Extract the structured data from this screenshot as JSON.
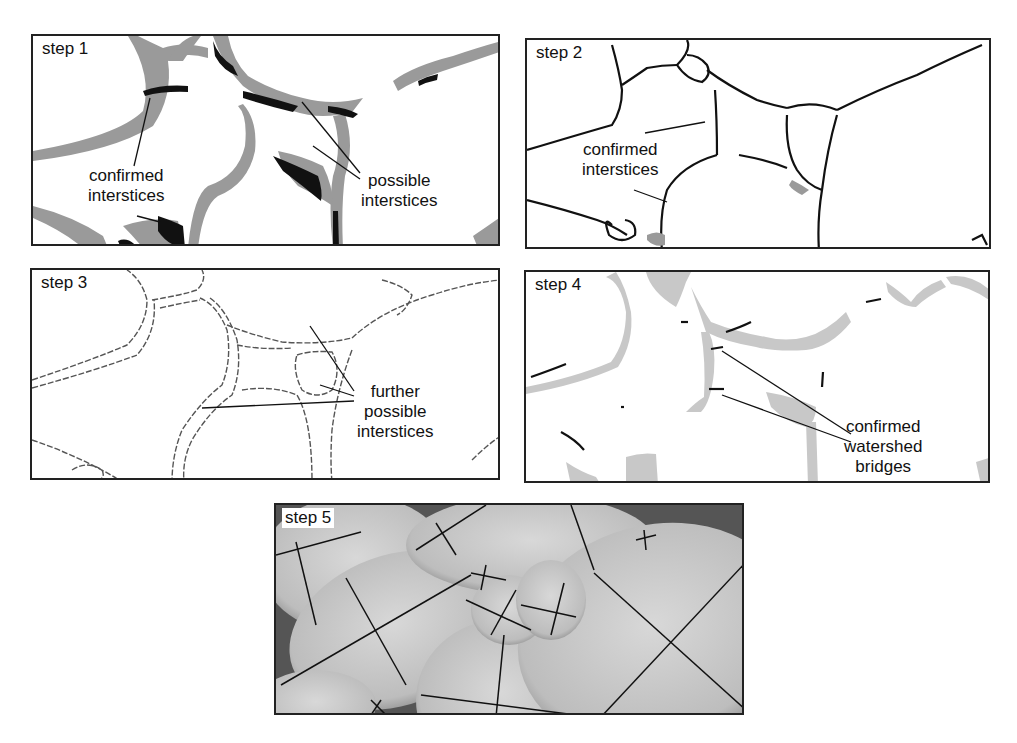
{
  "figure": {
    "panels": [
      {
        "id": "step1",
        "label": "step 1",
        "callouts": [
          {
            "text_lines": [
              "confirmed",
              "interstices"
            ],
            "line1": "confirmed",
            "line2": "interstices"
          },
          {
            "text_lines": [
              "possible",
              "interstices"
            ],
            "line1": "possible",
            "line2": "interstices"
          }
        ]
      },
      {
        "id": "step2",
        "label": "step 2",
        "callouts": [
          {
            "line1": "confirmed",
            "line2": "interstices"
          }
        ]
      },
      {
        "id": "step3",
        "label": "step 3",
        "callouts": [
          {
            "line1": "further",
            "line2": "possible",
            "line3": "interstices"
          }
        ]
      },
      {
        "id": "step4",
        "label": "step 4",
        "callouts": [
          {
            "line1": "confirmed",
            "line2": "watershed",
            "line3": "bridges"
          }
        ]
      },
      {
        "id": "step5",
        "label": "step 5",
        "callouts": []
      }
    ],
    "colors": {
      "border": "#222222",
      "confirmed_black": "#111111",
      "possible_gray": "#9a9a9a",
      "bridge_lightgray": "#c8c8c8",
      "grain_gray": "#c4c4c4"
    }
  }
}
